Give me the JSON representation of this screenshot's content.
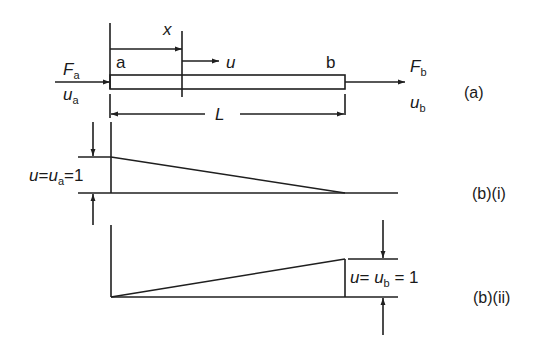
{
  "figure": {
    "part_a": {
      "caption": "(a)",
      "left_end": {
        "label": "a",
        "force": "F",
        "force_sub": "a",
        "disp": "u",
        "disp_sub": "a"
      },
      "right_end": {
        "label": "b",
        "force": "F",
        "force_sub": "b",
        "disp": "u",
        "disp_sub": "b"
      },
      "section_coord": "x",
      "section_disp": "u",
      "length": "L"
    },
    "part_b_i": {
      "caption": "(b)(i)",
      "eq_u": "u",
      "eq_eq1": "=",
      "eq_ua": "u",
      "eq_ua_sub": "a",
      "eq_val": "=1"
    },
    "part_b_ii": {
      "caption": "(b)(ii)",
      "eq_u": "u",
      "eq_eq1": "= ",
      "eq_ub": "u",
      "eq_ub_sub": "b",
      "eq_val": " = 1"
    },
    "colors": {
      "line": "#1f1f1f",
      "text": "#1a1a1a",
      "background": "#ffffff"
    }
  }
}
